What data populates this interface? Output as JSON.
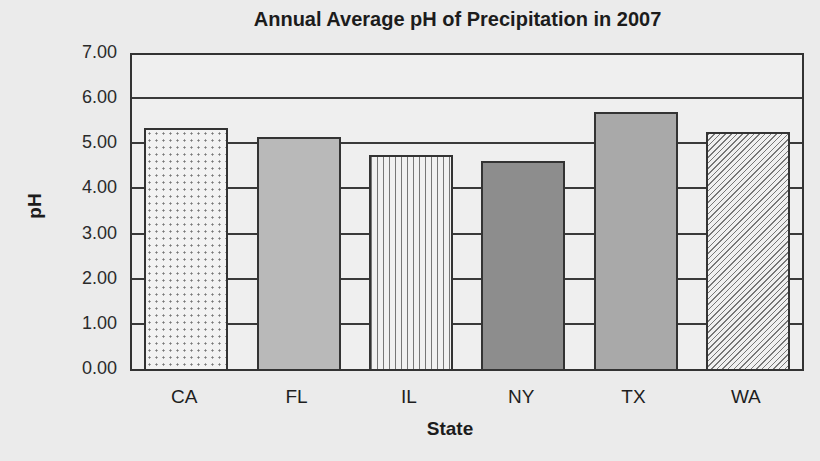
{
  "chart_data": {
    "type": "bar",
    "title": "Annual Average pH of Precipitation in 2007",
    "xlabel": "State",
    "ylabel": "pH",
    "categories": [
      "CA",
      "FL",
      "IL",
      "NY",
      "TX",
      "WA"
    ],
    "values": [
      5.33,
      5.13,
      4.74,
      4.6,
      5.7,
      5.26
    ],
    "ylim": [
      0,
      7
    ],
    "yticks": [
      "0.00",
      "1.00",
      "2.00",
      "3.00",
      "4.00",
      "5.00",
      "6.00",
      "7.00"
    ],
    "grid": true,
    "legend": null,
    "bar_patterns": [
      "dotted",
      "light-gray",
      "vertical-lines",
      "dark-gray",
      "medium-gray",
      "diagonal-hatch"
    ]
  }
}
